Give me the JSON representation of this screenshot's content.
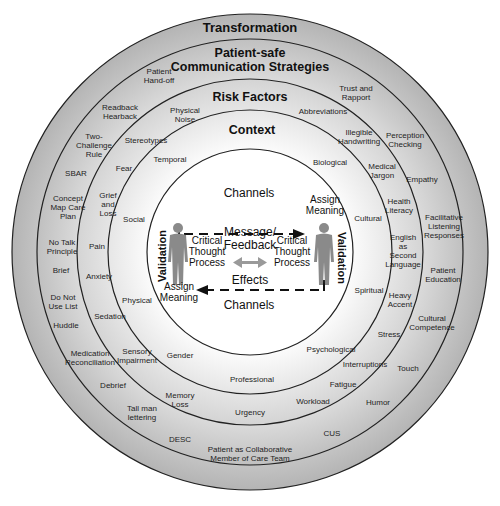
{
  "diagram": {
    "rings": [
      {
        "name": "Transformation",
        "title": "Transformation"
      },
      {
        "name": "Patient-safe Communication Strategies",
        "title": "Patient-safe\nCommunication Strategies"
      },
      {
        "name": "Risk Factors",
        "title": "Risk Factors"
      },
      {
        "name": "Context",
        "title": "Context"
      }
    ],
    "strategies": [
      "Patient\nHand-off",
      "Readback\nHearback",
      "Two-\nChallenge\nRule",
      "SBAR",
      "Concept\nMap Care\nPlan",
      "No Talk\nPrinciple",
      "Brief",
      "Do Not\nUse List",
      "Huddle",
      "Medication\nReconciliation",
      "Debrief",
      "Tall man\nlettering",
      "DESC",
      "Patient as Collaborative\nMember of Care Team",
      "CUS",
      "Humor",
      "Touch",
      "Cultural\nCompetence",
      "Patient\nEducation",
      "Facilitative\nListening\nResponses",
      "Empathy",
      "Perception\nChecking",
      "Trust and\nRapport"
    ],
    "risk_factors": [
      "Physical\nNoise",
      "Stereotypes",
      "Fear",
      "Grief\nand\nLoss",
      "Pain",
      "Anxiety",
      "Sedation",
      "Sensory\nImpairment",
      "Memory\nLoss",
      "Urgency",
      "Workload",
      "Fatigue",
      "Interruptions",
      "Stress",
      "Heavy\nAccent",
      "English\nas\nSecond\nLanguage",
      "Health\nLiteracy",
      "Medical\nJargon",
      "Illegible\nHandwriting",
      "Abbreviations"
    ],
    "context": [
      "Temporal",
      "Social",
      "Physical",
      "Gender",
      "Professional",
      "Psychological",
      "Spiritual",
      "Cultural",
      "Biological"
    ],
    "core": {
      "channels_top": "Channels",
      "channels_bottom": "Channels",
      "assign_meaning_right": "Assign\nMeaning",
      "assign_meaning_left": "Assign\nMeaning",
      "critical_left": "Critical\nThought\nProcess",
      "critical_right": "Critical\nThought\nProcess",
      "message": "Message/\nFeedback",
      "effects": "Effects",
      "validation_left": "Validation",
      "validation_right": "Validation"
    },
    "colors": {
      "ring_outer": "#b9b9b9",
      "ring_inner": "#f4f4f4",
      "line": "#222222",
      "figure": "#8a8a8a",
      "arrow_grey": "#9a9a9a"
    }
  }
}
